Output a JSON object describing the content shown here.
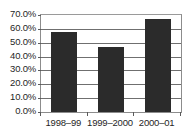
{
  "chart_data": {
    "type": "bar",
    "title": "",
    "subtitle": "",
    "xlabel": "",
    "ylabel": "",
    "categories": [
      "1998–99",
      "1999–2000",
      "2000–01"
    ],
    "values": [
      58,
      47,
      67
    ],
    "value_labels": [
      "58.0%",
      "47.0%",
      "67.0%"
    ],
    "ylim": [
      0,
      70
    ],
    "ytick_values": [
      70,
      60,
      50,
      40,
      30,
      20,
      10,
      0
    ],
    "ytick_labels": [
      "70.0%",
      "60.0%",
      "50.0%",
      "40.0%",
      "30.0%",
      "20.0%",
      "10.0%",
      "0.0%"
    ],
    "grid": true,
    "grid_axis": "y",
    "legend": false,
    "legend_position": "none",
    "bar_color": "#2b2b2b",
    "grid_color": "#6f6f6f",
    "axis_color": "#8c8c8c",
    "text_color": "#1f1f1f",
    "background_color": "#ffffff"
  }
}
